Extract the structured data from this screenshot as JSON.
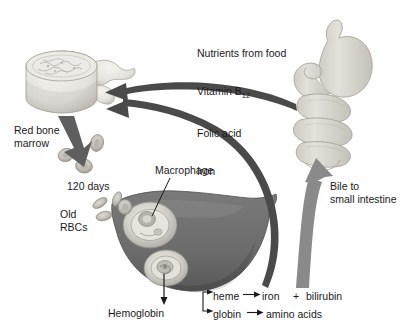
{
  "figure": {
    "background_color": "#ffffff",
    "text_color": "#1a1a1a"
  },
  "labels": {
    "nutrients_line1": "Nutrients from food",
    "nutrients_line2_prefix": "Vitamin B",
    "nutrients_line2_sub": "12",
    "nutrients_line3": "Folic acid",
    "nutrients_line4": "Iron",
    "red_bone_marrow": "Red bone\nmarrow",
    "days": "120 days",
    "old_rbcs": "Old\nRBCs",
    "macrophage": "Macrophage",
    "bile": "Bile to\nsmall intestine",
    "hemoglobin": "Hemoglobin",
    "heme": "heme",
    "iron": "iron",
    "plus": "+",
    "bilirubin": "bilirubin",
    "globin": "globin",
    "amino_acids": "amino acids"
  },
  "organs": [
    {
      "name": "vertebra-bone",
      "label": "Vertebra with red bone marrow",
      "fill": "#e8e6e1"
    },
    {
      "name": "stomach-small-intestine",
      "label": "Stomach and small intestine",
      "fill": "#d8d6cf"
    },
    {
      "name": "liver",
      "label": "Liver",
      "fill": "#6f6f6f"
    },
    {
      "name": "macrophage-cell",
      "label": "Macrophage in liver",
      "fill": "#efefe9"
    },
    {
      "name": "hemoglobin-site",
      "label": "Hemoglobin breakdown site in liver",
      "fill": "#efefe9"
    }
  ],
  "cells": [
    {
      "name": "new-rbc",
      "count": 3,
      "fill": "#c9c7c1"
    },
    {
      "name": "old-rbc",
      "count": 4,
      "fill": "#b9b7b1"
    }
  ],
  "arrows": [
    {
      "name": "nutrient-absorption-arrow",
      "from": "small intestine",
      "to": "red bone marrow",
      "color": "#4a4a4a"
    },
    {
      "name": "iron-recycling-arrow",
      "from": "liver",
      "to": "red bone marrow",
      "color": "#4a4a4a"
    },
    {
      "name": "rbc-production-arrow",
      "from": "red bone marrow",
      "to": "circulating red blood cells",
      "color": "#6a6a6a"
    },
    {
      "name": "bile-arrow",
      "from": "liver",
      "to": "small intestine",
      "color": "#8a8a8a"
    },
    {
      "name": "hemoglobin-breakdown-arrow",
      "from": "liver",
      "to": "hemoglobin",
      "color": "#1a1a1a"
    },
    {
      "name": "heme-arrow",
      "from": "heme",
      "to": "iron + bilirubin",
      "color": "#1a1a1a"
    },
    {
      "name": "globin-arrow",
      "from": "globin",
      "to": "amino acids",
      "color": "#1a1a1a"
    },
    {
      "name": "macrophage-leader-line",
      "from": "Macrophage label",
      "to": "macrophage cell",
      "color": "#1a1a1a"
    }
  ],
  "colors": {
    "bone": "#e8e6e1",
    "bone_shade": "#cbc8c1",
    "gut": "#d8d6cf",
    "gut_shade": "#bcb9b1",
    "liver": "#6f6f6f",
    "liver_dark": "#5a5a5a",
    "liver_light": "#efefe9",
    "arrow_dark": "#4a4a4a",
    "arrow_mid": "#6a6a6a",
    "arrow_light": "#8a8a8a",
    "text": "#1a1a1a"
  }
}
